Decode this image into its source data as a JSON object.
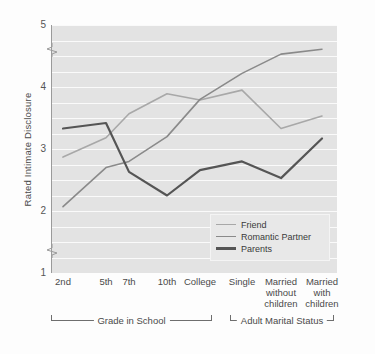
{
  "chart_data": {
    "type": "line",
    "title": "",
    "xlabel": "",
    "ylabel": "Rated Intimate Disclosure",
    "ylim": [
      1,
      5
    ],
    "yticks": [
      1,
      2,
      3,
      4,
      5
    ],
    "grid": true,
    "axis_break": true,
    "legend_position": "lower-right",
    "categories": [
      "2nd",
      "5th",
      "7th",
      "10th",
      "College",
      "Single",
      "Married without children",
      "Married with children"
    ],
    "tick_labels": [
      {
        "line1": "2nd",
        "line2": "",
        "line3": ""
      },
      {
        "line1": "5th",
        "line2": "",
        "line3": ""
      },
      {
        "line1": "7th",
        "line2": "",
        "line3": ""
      },
      {
        "line1": "10th",
        "line2": "",
        "line3": ""
      },
      {
        "line1": "College",
        "line2": "",
        "line3": ""
      },
      {
        "line1": "Single",
        "line2": "",
        "line3": ""
      },
      {
        "line1": "Married",
        "line2": "without",
        "line3": "children"
      },
      {
        "line1": "Married",
        "line2": "with",
        "line3": "children"
      }
    ],
    "series": [
      {
        "name": "Friend",
        "color": "#a8a8a8",
        "width": 1.6,
        "values": [
          2.87,
          3.18,
          3.57,
          3.89,
          3.79,
          3.95,
          3.33,
          3.53
        ]
      },
      {
        "name": "Romantic Partner",
        "color": "#8a8a8a",
        "width": 1.6,
        "values": [
          2.07,
          2.7,
          2.8,
          3.2,
          3.8,
          4.22,
          4.53,
          4.61
        ]
      },
      {
        "name": "Parents",
        "color": "#555555",
        "width": 2.2,
        "values": [
          3.33,
          3.42,
          2.63,
          2.25,
          2.66,
          2.8,
          2.53,
          3.17
        ]
      }
    ],
    "groups": [
      {
        "label": "Grade in School",
        "from": 0,
        "to": 4
      },
      {
        "label": "Adult Marital Status",
        "from": 5,
        "to": 7
      }
    ]
  }
}
